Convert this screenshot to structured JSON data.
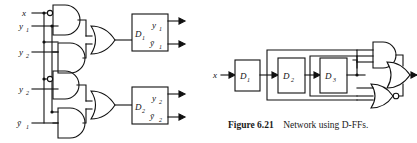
{
  "figure": {
    "caption_label": "Figure 6.21",
    "caption_text": "Network using D-FFs."
  },
  "left_circuit": {
    "name": "excitation-logic-network",
    "inputs": [
      {
        "id": "in-x",
        "label": "x",
        "sub": ""
      },
      {
        "id": "in-y1",
        "label": "y",
        "sub": "1"
      },
      {
        "id": "in-y2-upper",
        "label": "y",
        "sub": "2"
      },
      {
        "id": "in-y2-lower",
        "label": "y",
        "sub": "2"
      },
      {
        "id": "in-y1-bar",
        "label": "ȳ",
        "sub": "1"
      }
    ],
    "gates": [
      {
        "id": "and-1",
        "type": "AND",
        "inverted_input": true
      },
      {
        "id": "and-2",
        "type": "AND",
        "inverted_input": false
      },
      {
        "id": "and-3",
        "type": "AND",
        "inverted_input": true
      },
      {
        "id": "and-4",
        "type": "AND",
        "inverted_input": false
      },
      {
        "id": "or-1",
        "type": "OR",
        "inverted_input": false
      },
      {
        "id": "or-2",
        "type": "OR",
        "inverted_input": false
      }
    ],
    "flipflops": [
      {
        "id": "ff-d1",
        "input_label": "D",
        "input_sub": "1",
        "out_q_label": "y",
        "out_q_sub": "1",
        "out_qbar_label": "ȳ",
        "out_qbar_sub": "1"
      },
      {
        "id": "ff-d2",
        "input_label": "D",
        "input_sub": "2",
        "out_q_label": "y",
        "out_q_sub": "2",
        "out_qbar_label": "ȳ",
        "out_qbar_sub": "2"
      }
    ]
  },
  "right_circuit": {
    "name": "d-ff-chain-network",
    "input_label": "x",
    "flipflops": [
      {
        "id": "ff-r1",
        "label": "D",
        "sub": "1"
      },
      {
        "id": "ff-r2",
        "label": "D",
        "sub": "2"
      },
      {
        "id": "ff-r3",
        "label": "D",
        "sub": "3"
      }
    ],
    "gates": [
      {
        "id": "and-r1",
        "type": "AND",
        "bubble": false
      },
      {
        "id": "nor-r1",
        "type": "NOR",
        "bubble": true
      },
      {
        "id": "or-r1",
        "type": "OR",
        "bubble": false
      }
    ]
  },
  "colors": {
    "line": "#111111",
    "background": "#ffffff",
    "text": "#111111"
  }
}
